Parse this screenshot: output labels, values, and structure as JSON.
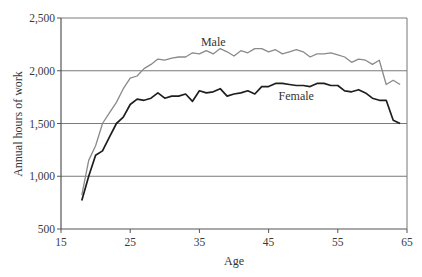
{
  "chart_data": {
    "type": "line",
    "title": "",
    "xlabel": "Age",
    "ylabel": "Annual hours of work",
    "xlim": [
      15,
      65
    ],
    "ylim": [
      500,
      2500
    ],
    "xticks": [
      15,
      25,
      35,
      45,
      55,
      65
    ],
    "xtick_labels": [
      "15",
      "25",
      "35",
      "45",
      "55",
      "65"
    ],
    "yticks": [
      500,
      1000,
      1500,
      2000,
      2500
    ],
    "ytick_labels": [
      "500",
      "1,000",
      "1,500",
      "2,000",
      "2,500"
    ],
    "grid": "horizontal",
    "legend": "inline labels",
    "x": [
      18,
      19,
      20,
      21,
      22,
      23,
      24,
      25,
      26,
      27,
      28,
      29,
      30,
      31,
      32,
      33,
      34,
      35,
      36,
      37,
      38,
      39,
      40,
      41,
      42,
      43,
      44,
      45,
      46,
      47,
      48,
      49,
      50,
      51,
      52,
      53,
      54,
      55,
      56,
      57,
      58,
      59,
      60,
      61,
      62,
      63,
      64
    ],
    "series": [
      {
        "name": "Male",
        "color": "#8a8a8a",
        "values": [
          820,
          1150,
          1290,
          1500,
          1600,
          1700,
          1830,
          1930,
          1950,
          2020,
          2060,
          2110,
          2100,
          2120,
          2130,
          2130,
          2170,
          2160,
          2190,
          2160,
          2210,
          2180,
          2140,
          2190,
          2170,
          2210,
          2210,
          2180,
          2200,
          2160,
          2180,
          2200,
          2180,
          2130,
          2160,
          2160,
          2170,
          2150,
          2130,
          2080,
          2110,
          2100,
          2060,
          2100,
          1870,
          1910,
          1870
        ]
      },
      {
        "name": "Female",
        "color": "#1e1e1e",
        "values": [
          770,
          1000,
          1200,
          1240,
          1370,
          1500,
          1560,
          1680,
          1730,
          1720,
          1740,
          1790,
          1740,
          1760,
          1760,
          1780,
          1710,
          1810,
          1790,
          1800,
          1830,
          1760,
          1780,
          1790,
          1810,
          1780,
          1850,
          1850,
          1880,
          1880,
          1870,
          1860,
          1860,
          1850,
          1880,
          1880,
          1860,
          1860,
          1810,
          1800,
          1820,
          1790,
          1740,
          1720,
          1720,
          1530,
          1500
        ]
      }
    ],
    "annotations": [
      {
        "text": "Male",
        "x": 37,
        "y": 2230
      },
      {
        "text": "Female",
        "x": 49,
        "y": 1720
      }
    ]
  }
}
